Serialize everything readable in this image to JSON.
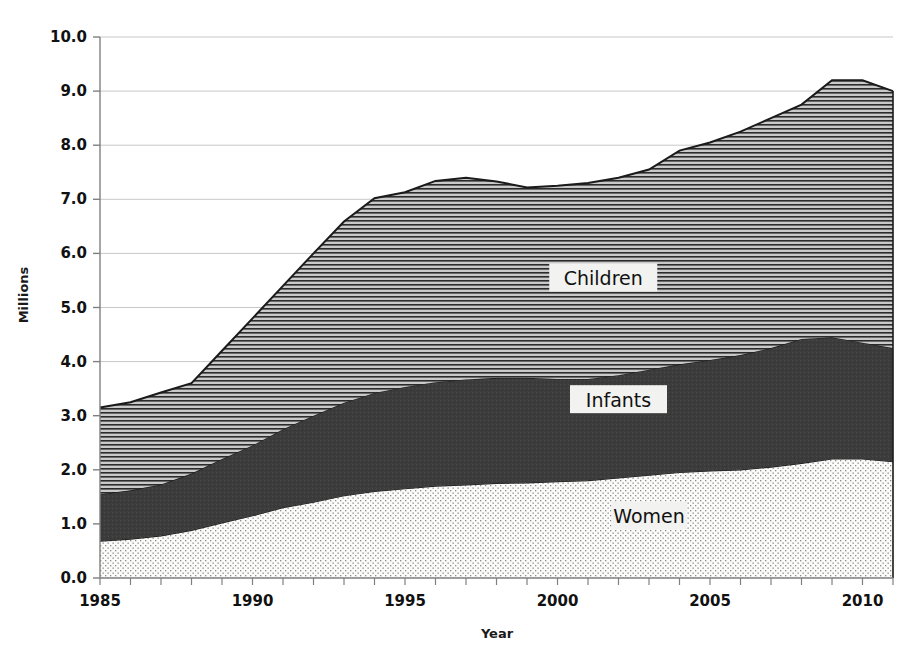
{
  "chart_data": {
    "type": "area",
    "stacked": true,
    "title": "",
    "xlabel": "Year",
    "ylabel": "Millions",
    "xlim": [
      1985,
      2011
    ],
    "ylim": [
      0.0,
      10.0
    ],
    "grid": true,
    "grid_axis": "y",
    "legend_position": "inline-annotations",
    "x": [
      1985,
      1986,
      1987,
      1988,
      1989,
      1990,
      1991,
      1992,
      1993,
      1994,
      1995,
      1996,
      1997,
      1998,
      1999,
      2000,
      2001,
      2002,
      2003,
      2004,
      2005,
      2006,
      2007,
      2008,
      2009,
      2010,
      2011
    ],
    "y_ticks": [
      "0.0",
      "1.0",
      "2.0",
      "3.0",
      "4.0",
      "5.0",
      "6.0",
      "7.0",
      "8.0",
      "9.0",
      "10.0"
    ],
    "y_tick_values": [
      0.0,
      1.0,
      2.0,
      3.0,
      4.0,
      5.0,
      6.0,
      7.0,
      8.0,
      9.0,
      10.0
    ],
    "x_ticks": [
      "1985",
      "1990",
      "1995",
      "2000",
      "2005",
      "2010"
    ],
    "x_tick_values": [
      1985,
      1990,
      1995,
      2000,
      2005,
      2010
    ],
    "x_minor_tick_step": 1,
    "series": [
      {
        "name": "Women",
        "fill_style": "stipple-dots",
        "color": "#f4f4f2",
        "values": [
          0.68,
          0.72,
          0.78,
          0.88,
          1.02,
          1.15,
          1.3,
          1.4,
          1.52,
          1.6,
          1.65,
          1.7,
          1.72,
          1.75,
          1.76,
          1.78,
          1.8,
          1.85,
          1.9,
          1.95,
          1.98,
          2.0,
          2.05,
          2.12,
          2.2,
          2.2,
          2.15
        ]
      },
      {
        "name": "Infants",
        "fill_style": "solid-dark",
        "color": "#3c3c3c",
        "values": [
          0.87,
          0.9,
          0.95,
          1.05,
          1.18,
          1.3,
          1.45,
          1.6,
          1.72,
          1.82,
          1.88,
          1.92,
          1.95,
          1.95,
          1.94,
          1.9,
          1.88,
          1.9,
          1.95,
          2.0,
          2.05,
          2.12,
          2.2,
          2.3,
          2.25,
          2.15,
          2.1
        ]
      },
      {
        "name": "Children",
        "fill_style": "horizontal-lines",
        "color": "#bdbdbd",
        "values": [
          1.6,
          1.63,
          1.7,
          1.67,
          2.0,
          2.35,
          2.65,
          3.0,
          3.35,
          3.6,
          3.6,
          3.72,
          3.73,
          3.63,
          3.52,
          3.57,
          3.62,
          3.65,
          3.7,
          3.95,
          4.02,
          4.13,
          4.25,
          4.33,
          4.75,
          4.85,
          4.75
        ]
      }
    ],
    "cumulative_totals": [
      3.15,
      3.25,
      3.43,
      3.6,
      4.2,
      4.8,
      5.4,
      6.0,
      6.59,
      7.02,
      7.13,
      7.34,
      7.4,
      7.33,
      7.22,
      7.25,
      7.3,
      7.4,
      7.55,
      7.9,
      8.05,
      8.25,
      8.5,
      8.75,
      9.2,
      9.2,
      9.0
    ],
    "annotations": [
      {
        "label": "Children",
        "x_value": 2001.5,
        "y_value": 5.5
      },
      {
        "label": "Infants",
        "x_value": 2002.0,
        "y_value": 3.25
      },
      {
        "label": "Women",
        "x_value": 2003.0,
        "y_value": 1.1
      }
    ]
  },
  "colors": {
    "axis": "#808080",
    "grid": "#c8c8c8",
    "outline": "#1a1a1a",
    "text": "#111111",
    "women_fill": "#f4f4f2",
    "infants_fill": "#3c3c3c",
    "children_fill": "#bdbdbd",
    "label_box": "#f2f2f0",
    "background": "#ffffff"
  }
}
